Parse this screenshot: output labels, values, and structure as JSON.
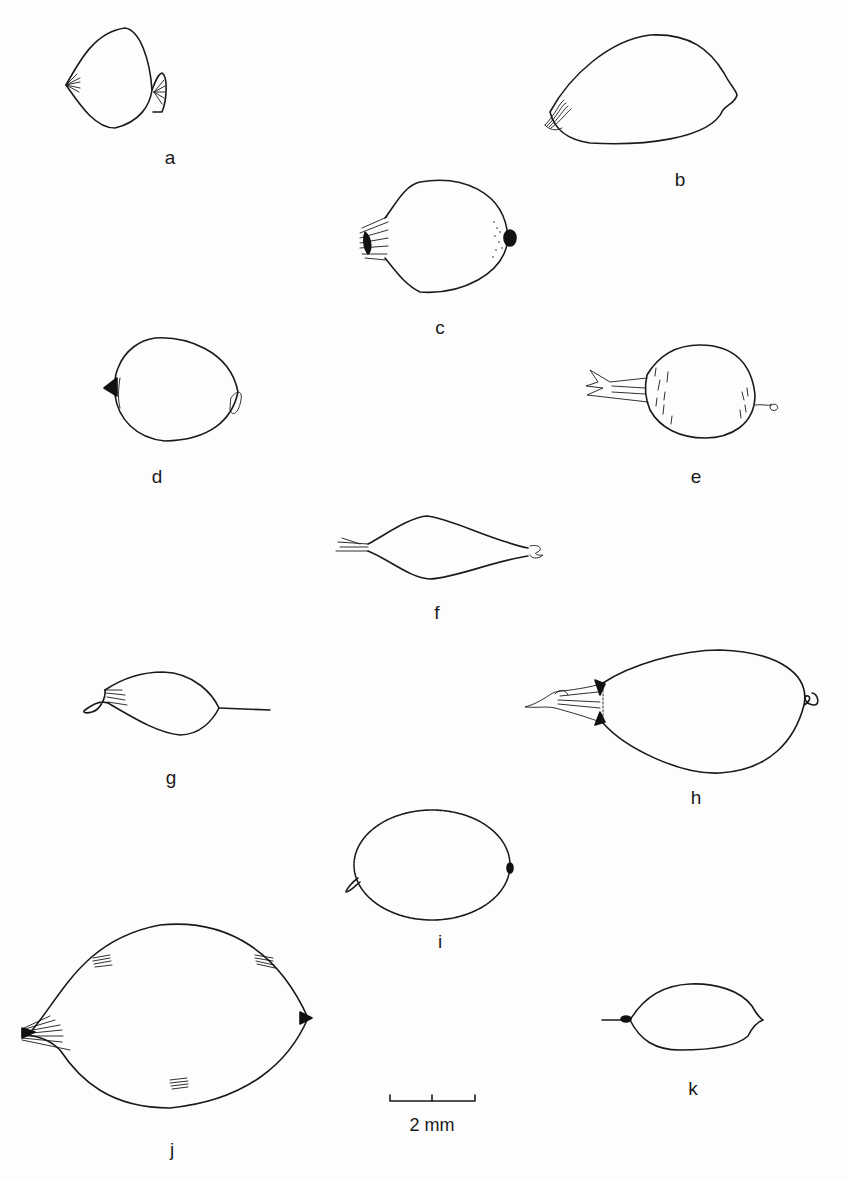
{
  "figure": {
    "type": "scientific-illustration",
    "stroke_color": "#1a1a1a",
    "background_color": "#fdfdfd",
    "specimens": [
      {
        "id": "a",
        "label": "a",
        "label_x": 170,
        "label_y": 148
      },
      {
        "id": "b",
        "label": "b",
        "label_x": 680,
        "label_y": 170
      },
      {
        "id": "c",
        "label": "c",
        "label_x": 440,
        "label_y": 318
      },
      {
        "id": "d",
        "label": "d",
        "label_x": 157,
        "label_y": 467
      },
      {
        "id": "e",
        "label": "e",
        "label_x": 696,
        "label_y": 467
      },
      {
        "id": "f",
        "label": "f",
        "label_x": 437,
        "label_y": 603
      },
      {
        "id": "g",
        "label": "g",
        "label_x": 171,
        "label_y": 768
      },
      {
        "id": "h",
        "label": "h",
        "label_x": 696,
        "label_y": 788
      },
      {
        "id": "i",
        "label": "i",
        "label_x": 440,
        "label_y": 932
      },
      {
        "id": "j",
        "label": "j",
        "label_x": 172,
        "label_y": 1140
      },
      {
        "id": "k",
        "label": "k",
        "label_x": 693,
        "label_y": 1079
      }
    ],
    "scale_bar": {
      "label": "2 mm",
      "x_start": 390,
      "x_end": 475,
      "y": 1101,
      "ticks": 3
    }
  }
}
